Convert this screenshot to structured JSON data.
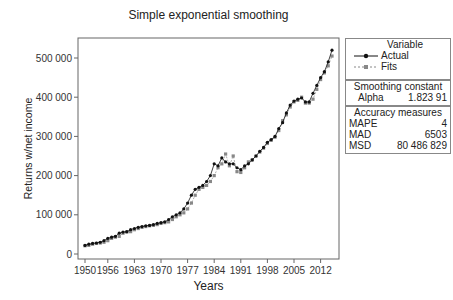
{
  "chart_data": {
    "type": "line",
    "title": "Simple exponential smoothing",
    "xlabel": "Years",
    "ylabel": "Returns w/net income",
    "xlim": [
      1950,
      2015
    ],
    "ylim": [
      0,
      520000
    ],
    "x_ticks": [
      "1950",
      "1956",
      "1963",
      "1970",
      "1977",
      "1984",
      "1991",
      "1998",
      "2005",
      "2012"
    ],
    "y_ticks": [
      "0",
      "100 000",
      "200 000",
      "300 000",
      "400 000",
      "500 000"
    ],
    "x": [
      1950,
      1951,
      1952,
      1953,
      1954,
      1955,
      1956,
      1957,
      1958,
      1959,
      1960,
      1961,
      1962,
      1963,
      1964,
      1965,
      1966,
      1967,
      1968,
      1969,
      1970,
      1971,
      1972,
      1973,
      1974,
      1975,
      1976,
      1977,
      1978,
      1979,
      1980,
      1981,
      1982,
      1983,
      1984,
      1985,
      1986,
      1987,
      1988,
      1989,
      1990,
      1991,
      1992,
      1993,
      1994,
      1995,
      1996,
      1997,
      1998,
      1999,
      2000,
      2001,
      2002,
      2003,
      2004,
      2005,
      2006,
      2007,
      2008,
      2009,
      2010,
      2011,
      2012,
      2013,
      2014,
      2015
    ],
    "series": [
      {
        "name": "Actual",
        "marker": "circle",
        "color": "#111111",
        "values": [
          22000,
          25000,
          27000,
          28000,
          30000,
          34000,
          40000,
          43000,
          45000,
          53000,
          56000,
          57000,
          62000,
          65000,
          68000,
          70000,
          72000,
          73000,
          75000,
          78000,
          80000,
          82000,
          88000,
          95000,
          100000,
          105000,
          115000,
          130000,
          150000,
          165000,
          170000,
          175000,
          185000,
          200000,
          230000,
          225000,
          245000,
          235000,
          230000,
          230000,
          220000,
          215000,
          225000,
          230000,
          240000,
          250000,
          262000,
          272000,
          285000,
          292000,
          300000,
          320000,
          335000,
          360000,
          380000,
          390000,
          395000,
          398000,
          388000,
          388000,
          410000,
          430000,
          450000,
          465000,
          490000,
          520000
        ]
      },
      {
        "name": "Fits",
        "marker": "square",
        "color": "#888888",
        "values": [
          21000,
          22000,
          25000,
          27000,
          28000,
          30000,
          34000,
          40000,
          43000,
          45000,
          53000,
          56000,
          57000,
          62000,
          65000,
          68000,
          70000,
          72000,
          73000,
          75000,
          78000,
          80000,
          82000,
          88000,
          95000,
          100000,
          105000,
          115000,
          130000,
          150000,
          165000,
          170000,
          175000,
          185000,
          200000,
          220000,
          230000,
          255000,
          225000,
          250000,
          210000,
          208000,
          220000,
          235000,
          240000,
          250000,
          260000,
          270000,
          282000,
          290000,
          298000,
          315000,
          340000,
          355000,
          375000,
          388000,
          392000,
          400000,
          385000,
          385000,
          395000,
          420000,
          445000,
          462000,
          480000,
          505000
        ]
      }
    ],
    "legend_position": "right",
    "grid": false
  },
  "legend": {
    "title": "Variable",
    "items": [
      "Actual",
      "Fits"
    ]
  },
  "smoothing": {
    "title": "Smoothing constant",
    "label": "Alpha",
    "value": "1.823 91"
  },
  "accuracy": {
    "title": "Accuracy measures",
    "rows": [
      {
        "label": "MAPE",
        "value": "4"
      },
      {
        "label": "MAD",
        "value": "6503"
      },
      {
        "label": "MSD",
        "value": "80 486 829"
      }
    ]
  }
}
